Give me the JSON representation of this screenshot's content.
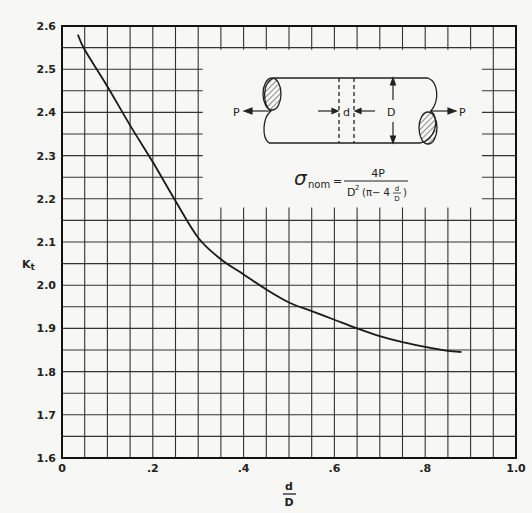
{
  "chart_data": {
    "type": "line",
    "title": "",
    "xlabel": "d/D",
    "xlabel_numerator": "d",
    "xlabel_denominator": "D",
    "ylabel": "Kt",
    "ylabel_main": "K",
    "ylabel_sub": "t",
    "xlim": [
      0,
      1.0
    ],
    "ylim": [
      1.6,
      2.6
    ],
    "x_ticks": [
      0,
      0.2,
      0.4,
      0.6,
      0.8,
      1.0
    ],
    "x_tick_labels": [
      "0",
      ".2",
      ".4",
      ".6",
      ".8",
      "1.0"
    ],
    "y_ticks": [
      1.6,
      1.7,
      1.8,
      1.9,
      2.0,
      2.1,
      2.2,
      2.3,
      2.4,
      2.5,
      2.6
    ],
    "y_tick_labels": [
      "1.6",
      "1.7",
      "1.8",
      "1.9",
      "2.0",
      "2.1",
      "2.2",
      "2.3",
      "2.4",
      "2.5",
      "2.6"
    ],
    "grid": true,
    "grid_step_x": 0.05,
    "grid_step_y": 0.05,
    "legend": null,
    "series": [
      {
        "name": "Kt",
        "x": [
          0.035,
          0.05,
          0.1,
          0.15,
          0.2,
          0.25,
          0.3,
          0.35,
          0.4,
          0.45,
          0.5,
          0.55,
          0.6,
          0.65,
          0.7,
          0.75,
          0.8,
          0.85,
          0.88
        ],
        "y": [
          2.58,
          2.545,
          2.46,
          2.37,
          2.285,
          2.195,
          2.11,
          2.06,
          2.025,
          1.99,
          1.96,
          1.94,
          1.92,
          1.9,
          1.882,
          1.868,
          1.857,
          1.848,
          1.845
        ]
      }
    ],
    "annotations": {
      "inset_diagram": "Cylindrical shaft in tension with transverse hole of diameter d; shaft diameter D; axial load P at both ends",
      "labels": [
        "P",
        "d",
        "D",
        "P"
      ],
      "formula": "σnom = 4P / (D²(π − 4 d/D))"
    }
  },
  "inset": {
    "load_left": "P",
    "load_right": "P",
    "hole_label": "d",
    "diameter_label": "D",
    "formula_lhs": "σ",
    "formula_sub": "nom",
    "formula_eq": "=",
    "formula_num": "4P",
    "formula_den_D": "D",
    "formula_den_sq": "2",
    "formula_den_open": "(π− 4",
    "formula_den_frac_num": "d",
    "formula_den_frac_den": "D",
    "formula_den_close": ")"
  }
}
